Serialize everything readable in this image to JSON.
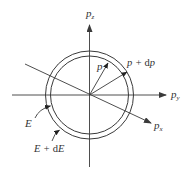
{
  "figure": {
    "type": "momentum-space shell diagram",
    "colors": {
      "background": "#ffffff",
      "stroke": "#3a3a3a",
      "text": "#333333"
    },
    "center": [
      89.5,
      95
    ],
    "inner_radius": 39,
    "outer_radius": 44,
    "axes": {
      "pz": {
        "label_main": "p",
        "label_sub": "z"
      },
      "py": {
        "label_main": "p",
        "label_sub": "y"
      },
      "px": {
        "label_main": "p",
        "label_sub": "x"
      }
    },
    "vectors": {
      "inner": {
        "label": "p"
      },
      "outer": {
        "label_main": "p + d",
        "label_tail": "p"
      }
    },
    "shells": {
      "inner": {
        "label": "E"
      },
      "outer": {
        "label_main": "E + d",
        "label_tail": "E"
      }
    }
  }
}
